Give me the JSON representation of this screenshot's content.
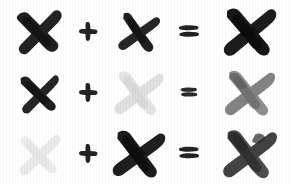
{
  "canvas": {
    "width": 290,
    "height": 184,
    "background": "#ffffff",
    "title": "brush-stroke x mark addition grid"
  },
  "palette": {
    "ink_black": "#1a1a1a",
    "ink_dark": "#232323",
    "ink_mid": "#7d7d7d",
    "ink_light": "#e2e2e2",
    "ink_faint": "#ececec",
    "paper": "#ffffff"
  },
  "symbols": {
    "plus": "+",
    "equals": "=",
    "mark": "x-mark"
  },
  "rows": [
    {
      "id": "row-0",
      "operand_a": {
        "name": "x-mark",
        "shade": "dark",
        "color": "#1f1f1f",
        "opacity": 1.0,
        "size": 54,
        "rotate": -4
      },
      "operator": {
        "name": "plus",
        "glyph": "+",
        "color": "#222222"
      },
      "operand_b": {
        "name": "x-mark",
        "shade": "dark",
        "color": "#1f1f1f",
        "opacity": 1.0,
        "size": 48,
        "rotate": 6
      },
      "relation": {
        "name": "equals",
        "glyph": "=",
        "color": "#222222"
      },
      "result": {
        "name": "x-mark",
        "shade": "dark",
        "color": "#181818",
        "opacity": 1.0,
        "size": 58,
        "rotate": 2
      }
    },
    {
      "id": "row-1",
      "operand_a": {
        "name": "x-mark",
        "shade": "dark",
        "color": "#1f1f1f",
        "opacity": 1.0,
        "size": 48,
        "rotate": -6
      },
      "operator": {
        "name": "plus",
        "glyph": "+",
        "color": "#222222"
      },
      "operand_b": {
        "name": "x-mark",
        "shade": "light",
        "color": "#e4e4e4",
        "opacity": 1.0,
        "size": 54,
        "rotate": 4
      },
      "relation": {
        "name": "equals",
        "glyph": "=",
        "color": "#2a2a2a"
      },
      "result": {
        "name": "x-mark",
        "shade": "mid",
        "color": "#8a8a8a",
        "opacity": 1.0,
        "size": 56,
        "rotate": 3
      }
    },
    {
      "id": "row-2",
      "operand_a": {
        "name": "x-mark",
        "shade": "faint",
        "color": "#ededed",
        "opacity": 1.0,
        "size": 50,
        "rotate": -3
      },
      "operator": {
        "name": "plus",
        "glyph": "+",
        "color": "#222222"
      },
      "operand_b": {
        "name": "x-mark",
        "shade": "dark",
        "color": "#1c1c1c",
        "opacity": 1.0,
        "size": 56,
        "rotate": 5
      },
      "relation": {
        "name": "equals",
        "glyph": "=",
        "color": "#222222"
      },
      "result": {
        "name": "x-mark",
        "shade": "mid-dark",
        "color": "#4a4a4a",
        "opacity": 1.0,
        "size": 58,
        "rotate": 4
      }
    }
  ]
}
